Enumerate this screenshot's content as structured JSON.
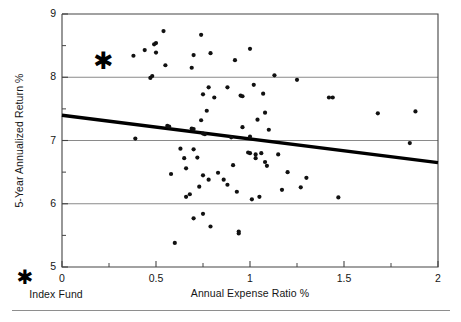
{
  "chart_data": {
    "type": "scatter",
    "title": "",
    "xlabel": "Annual Expense Ratio %",
    "ylabel": "5-Year Annualized Return %",
    "xlim": [
      0,
      2
    ],
    "ylim": [
      5,
      9
    ],
    "xticks": [
      "0",
      "0.5",
      "1",
      "1.5",
      "2"
    ],
    "xtick_values": [
      0,
      0.5,
      1,
      1.5,
      2
    ],
    "xminor_step": 0.25,
    "yticks": [
      "5",
      "6",
      "7",
      "8",
      "9"
    ],
    "ytick_values": [
      5,
      6,
      7,
      8,
      9
    ],
    "yminor_step": 0.5,
    "grid": "horizontal gridlines at y = 6, 7, 8",
    "gridlines_y": [
      6,
      7,
      8
    ],
    "legend_position": "below-left, outside axes",
    "series": [
      {
        "name": "Actively managed funds",
        "marker": "dot",
        "color": "#111111",
        "points": [
          [
            0.38,
            8.34
          ],
          [
            0.39,
            7.03
          ],
          [
            0.44,
            8.43
          ],
          [
            0.47,
            7.99
          ],
          [
            0.48,
            8.02
          ],
          [
            0.49,
            8.52
          ],
          [
            0.5,
            8.54
          ],
          [
            0.5,
            8.39
          ],
          [
            0.54,
            8.73
          ],
          [
            0.55,
            8.19
          ],
          [
            0.56,
            7.23
          ],
          [
            0.57,
            7.22
          ],
          [
            0.58,
            6.47
          ],
          [
            0.6,
            5.38
          ],
          [
            0.63,
            6.87
          ],
          [
            0.65,
            6.72
          ],
          [
            0.66,
            6.56
          ],
          [
            0.66,
            6.11
          ],
          [
            0.68,
            6.15
          ],
          [
            0.69,
            8.15
          ],
          [
            0.69,
            7.19
          ],
          [
            0.7,
            7.18
          ],
          [
            0.7,
            8.35
          ],
          [
            0.7,
            6.86
          ],
          [
            0.7,
            5.77
          ],
          [
            0.72,
            6.73
          ],
          [
            0.73,
            6.27
          ],
          [
            0.74,
            7.32
          ],
          [
            0.74,
            8.67
          ],
          [
            0.75,
            7.11
          ],
          [
            0.75,
            7.73
          ],
          [
            0.75,
            6.45
          ],
          [
            0.75,
            5.84
          ],
          [
            0.76,
            7.1
          ],
          [
            0.77,
            7.47
          ],
          [
            0.78,
            7.84
          ],
          [
            0.78,
            6.38
          ],
          [
            0.79,
            8.38
          ],
          [
            0.79,
            5.64
          ],
          [
            0.81,
            7.68
          ],
          [
            0.83,
            6.49
          ],
          [
            0.86,
            6.38
          ],
          [
            0.88,
            7.84
          ],
          [
            0.88,
            6.3
          ],
          [
            0.9,
            7.05
          ],
          [
            0.91,
            6.61
          ],
          [
            0.92,
            8.27
          ],
          [
            0.93,
            6.19
          ],
          [
            0.94,
            5.56
          ],
          [
            0.94,
            5.53
          ],
          [
            0.95,
            7.71
          ],
          [
            0.96,
            7.7
          ],
          [
            0.96,
            7.21
          ],
          [
            0.99,
            6.81
          ],
          [
            1.0,
            6.8
          ],
          [
            1.0,
            7.06
          ],
          [
            1.0,
            8.45
          ],
          [
            1.01,
            6.07
          ],
          [
            1.02,
            7.88
          ],
          [
            1.03,
            6.78
          ],
          [
            1.03,
            6.72
          ],
          [
            1.04,
            7.33
          ],
          [
            1.05,
            6.11
          ],
          [
            1.06,
            6.8
          ],
          [
            1.07,
            7.74
          ],
          [
            1.08,
            6.66
          ],
          [
            1.08,
            7.44
          ],
          [
            1.09,
            6.6
          ],
          [
            1.1,
            7.17
          ],
          [
            1.13,
            8.03
          ],
          [
            1.15,
            6.78
          ],
          [
            1.17,
            6.22
          ],
          [
            1.2,
            6.5
          ],
          [
            1.25,
            7.96
          ],
          [
            1.27,
            6.26
          ],
          [
            1.3,
            6.41
          ],
          [
            1.42,
            7.68
          ],
          [
            1.44,
            7.68
          ],
          [
            1.47,
            6.1
          ],
          [
            1.68,
            7.43
          ],
          [
            1.85,
            6.96
          ],
          [
            1.88,
            7.46
          ]
        ]
      },
      {
        "name": "Index Fund",
        "marker": "star",
        "color": "#000000",
        "points": [
          [
            0.22,
            8.25
          ]
        ]
      }
    ],
    "trendline": {
      "name": "Linear fit",
      "color": "#000000",
      "x": [
        0,
        2
      ],
      "y": [
        7.4,
        6.65
      ]
    },
    "annotations": []
  },
  "legend": {
    "index_fund_label": "Index Fund",
    "index_fund_marker": "star-icon"
  },
  "colors": {
    "axis": "#444444",
    "gridline": "#8a8a8a",
    "marker": "#111111",
    "trendline": "#000000",
    "rule": "#8e8e8e",
    "text": "#151515"
  }
}
